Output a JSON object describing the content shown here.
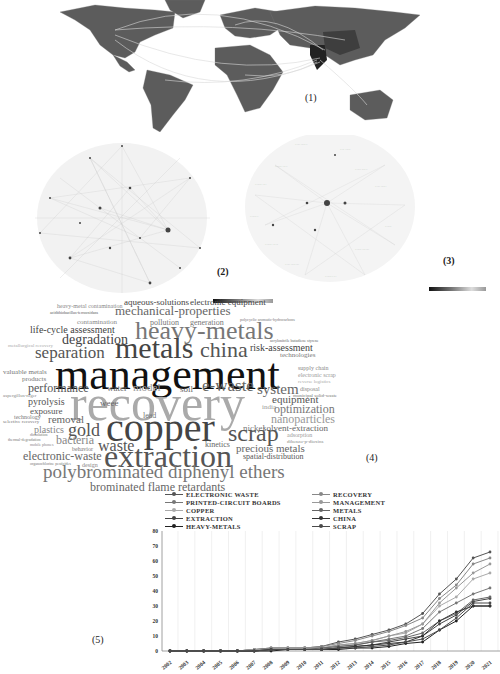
{
  "figure": {
    "panel_labels": [
      "(1)",
      "(2)",
      "(3)",
      "(4)",
      "(5)"
    ],
    "colorbar_ticks": [
      "2000",
      "2010",
      "2015",
      "2020"
    ]
  },
  "map": {
    "title": "World collaboration map",
    "label": "(1)",
    "highlighted_regions": [
      "India",
      "China",
      "USA",
      "Australia"
    ]
  },
  "network2": {
    "label": "(2)"
  },
  "network3": {
    "label": "(3)"
  },
  "wordcloud": {
    "label": "(4)",
    "words": [
      {
        "text": "heavy-metal contamination",
        "size": 6,
        "x": 57,
        "y": 303,
        "color": "#888"
      },
      {
        "text": "aqueous-solutions",
        "size": 9,
        "x": 124,
        "y": 298,
        "color": "#444"
      },
      {
        "text": "electronic equipment",
        "size": 9,
        "x": 190,
        "y": 298,
        "color": "#444"
      },
      {
        "text": "acidithiobacillus-ferrooxidans",
        "size": 4,
        "x": 50,
        "y": 311,
        "color": "#555"
      },
      {
        "text": "mechanical-properties",
        "size": 13,
        "x": 115,
        "y": 304,
        "color": "#666"
      },
      {
        "text": "polycyclic aromatic-hydrocarbons",
        "size": 4,
        "x": 240,
        "y": 318,
        "color": "#777"
      },
      {
        "text": "contamination",
        "size": 7,
        "x": 77,
        "y": 319,
        "color": "#888"
      },
      {
        "text": "pollution",
        "size": 8,
        "x": 150,
        "y": 319,
        "color": "#777"
      },
      {
        "text": "generation",
        "size": 8,
        "x": 190,
        "y": 319,
        "color": "#777"
      },
      {
        "text": "life-cycle assessment",
        "size": 10,
        "x": 30,
        "y": 325,
        "color": "#444"
      },
      {
        "text": "heavy-metals",
        "size": 26,
        "x": 135,
        "y": 318,
        "color": "#777"
      },
      {
        "text": "degradation",
        "size": 14,
        "x": 62,
        "y": 333,
        "color": "#444"
      },
      {
        "text": "acrylonitrile butadiene styrene",
        "size": 4,
        "x": 270,
        "y": 339,
        "color": "#666"
      },
      {
        "text": "metallurgical recovery",
        "size": 5,
        "x": 8,
        "y": 343,
        "color": "#aaa"
      },
      {
        "text": "risk-assessment",
        "size": 10,
        "x": 250,
        "y": 343,
        "color": "#444"
      },
      {
        "text": "separation",
        "size": 17,
        "x": 35,
        "y": 344,
        "color": "#555"
      },
      {
        "text": "metals",
        "size": 30,
        "x": 115,
        "y": 333,
        "color": "#444"
      },
      {
        "text": "china",
        "size": 22,
        "x": 200,
        "y": 339,
        "color": "#555"
      },
      {
        "text": "technologies",
        "size": 7,
        "x": 280,
        "y": 352,
        "color": "#777"
      },
      {
        "text": "valuable metals",
        "size": 7,
        "x": 3,
        "y": 369,
        "color": "#777"
      },
      {
        "text": "management",
        "size": 44,
        "x": 55,
        "y": 353,
        "color": "#111"
      },
      {
        "text": "supply chain",
        "size": 6,
        "x": 298,
        "y": 365,
        "color": "#888"
      },
      {
        "text": "electronic scrap",
        "size": 6,
        "x": 298,
        "y": 372,
        "color": "#999"
      },
      {
        "text": "reverse logistics",
        "size": 5,
        "x": 298,
        "y": 379,
        "color": "#aaa"
      },
      {
        "text": "products",
        "size": 7,
        "x": 22,
        "y": 376,
        "color": "#777"
      },
      {
        "text": "performance",
        "size": 12,
        "x": 28,
        "y": 382,
        "color": "#555"
      },
      {
        "text": "water",
        "size": 9,
        "x": 107,
        "y": 384,
        "color": "#666"
      },
      {
        "text": "model",
        "size": 11,
        "x": 133,
        "y": 382,
        "color": "#999"
      },
      {
        "text": "soil",
        "size": 9,
        "x": 180,
        "y": 385,
        "color": "#666"
      },
      {
        "text": "e-waste",
        "size": 17,
        "x": 202,
        "y": 377,
        "color": "#666"
      },
      {
        "text": "system",
        "size": 15,
        "x": 257,
        "y": 382,
        "color": "#666"
      },
      {
        "text": "disposal",
        "size": 6,
        "x": 300,
        "y": 386,
        "color": "#888"
      },
      {
        "text": "municipal solid-waste",
        "size": 5,
        "x": 293,
        "y": 393,
        "color": "#777"
      },
      {
        "text": "aspergillus-niger",
        "size": 5,
        "x": 3,
        "y": 393,
        "color": "#888"
      },
      {
        "text": "recovery",
        "size": 50,
        "x": 70,
        "y": 378,
        "color": "#aaa"
      },
      {
        "text": "equipment",
        "size": 11,
        "x": 272,
        "y": 394,
        "color": "#555"
      },
      {
        "text": "pyrolysis",
        "size": 10,
        "x": 28,
        "y": 397,
        "color": "#555"
      },
      {
        "text": "weee",
        "size": 9,
        "x": 100,
        "y": 399,
        "color": "#666"
      },
      {
        "text": "india",
        "size": 7,
        "x": 262,
        "y": 404,
        "color": "#999"
      },
      {
        "text": "optimization",
        "size": 12,
        "x": 274,
        "y": 403,
        "color": "#777"
      },
      {
        "text": "exposure",
        "size": 9,
        "x": 30,
        "y": 407,
        "color": "#555"
      },
      {
        "text": "nanoparticles",
        "size": 12,
        "x": 271,
        "y": 413,
        "color": "#999"
      },
      {
        "text": "technology",
        "size": 6,
        "x": 14,
        "y": 414,
        "color": "#777"
      },
      {
        "text": "selective recovery",
        "size": 5,
        "x": 3,
        "y": 419,
        "color": "#777"
      },
      {
        "text": "lead",
        "size": 8,
        "x": 143,
        "y": 412,
        "color": "#777"
      },
      {
        "text": "removal",
        "size": 11,
        "x": 48,
        "y": 414,
        "color": "#666"
      },
      {
        "text": "copper",
        "size": 40,
        "x": 106,
        "y": 408,
        "color": "#444"
      },
      {
        "text": "plastics",
        "size": 10,
        "x": 34,
        "y": 425,
        "color": "#888"
      },
      {
        "text": "gold",
        "size": 18,
        "x": 68,
        "y": 421,
        "color": "#555"
      },
      {
        "text": "nickel",
        "size": 9,
        "x": 243,
        "y": 424,
        "color": "#777"
      },
      {
        "text": "solvent-extraction",
        "size": 9,
        "x": 263,
        "y": 424,
        "color": "#666"
      },
      {
        "text": "scrap",
        "size": 24,
        "x": 228,
        "y": 421,
        "color": "#555"
      },
      {
        "text": "adsorption",
        "size": 6,
        "x": 287,
        "y": 432,
        "color": "#999"
      },
      {
        "text": "dibenzo-p-dioxins",
        "size": 5,
        "x": 287,
        "y": 439,
        "color": "#888"
      },
      {
        "text": "dissolution",
        "size": 4,
        "x": 30,
        "y": 433,
        "color": "#777"
      },
      {
        "text": "thermal-degradation",
        "size": 4,
        "x": 8,
        "y": 438,
        "color": "#777"
      },
      {
        "text": "mobile phones",
        "size": 4,
        "x": 30,
        "y": 443,
        "color": "#888"
      },
      {
        "text": "bacteria",
        "size": 12,
        "x": 56,
        "y": 434,
        "color": "#888"
      },
      {
        "text": "kinetics",
        "size": 8,
        "x": 205,
        "y": 441,
        "color": "#666"
      },
      {
        "text": "behavior",
        "size": 6,
        "x": 72,
        "y": 446,
        "color": "#777"
      },
      {
        "text": "waste",
        "size": 16,
        "x": 98,
        "y": 438,
        "color": "#555"
      },
      {
        "text": "precious metals",
        "size": 11,
        "x": 236,
        "y": 443,
        "color": "#666"
      },
      {
        "text": "electronic-waste",
        "size": 12,
        "x": 23,
        "y": 450,
        "color": "#666"
      },
      {
        "text": "extraction",
        "size": 32,
        "x": 104,
        "y": 440,
        "color": "#555"
      },
      {
        "text": "spatial-distribution",
        "size": 8,
        "x": 243,
        "y": 453,
        "color": "#555"
      },
      {
        "text": "organochlorine pesticides",
        "size": 4,
        "x": 30,
        "y": 462,
        "color": "#777"
      },
      {
        "text": "design",
        "size": 6,
        "x": 82,
        "y": 462,
        "color": "#888"
      },
      {
        "text": "polybrominated diphenyl ethers",
        "size": 19,
        "x": 43,
        "y": 462,
        "color": "#777"
      },
      {
        "text": "brominated flame retardants",
        "size": 12,
        "x": 90,
        "y": 481,
        "color": "#666"
      }
    ]
  },
  "chart_data": {
    "type": "line",
    "title": "",
    "label": "(5)",
    "xlabel": "",
    "ylabel": "",
    "ylim": [
      0,
      80
    ],
    "yticks": [
      0,
      10,
      20,
      30,
      40,
      50,
      60,
      70,
      80
    ],
    "grid": "vertical",
    "legend_position": "top",
    "categories": [
      "2002",
      "2003",
      "2004",
      "2005",
      "2006",
      "2007",
      "2008",
      "2009",
      "2010",
      "2011",
      "2012",
      "2013",
      "2014",
      "2015",
      "2016",
      "2017",
      "2018",
      "2019",
      "2020",
      "2021"
    ],
    "series": [
      {
        "name": "ELECTRONIC WASTE",
        "color": "#555555",
        "values": [
          0,
          0,
          0,
          0,
          0,
          1,
          2,
          2,
          2,
          3,
          6,
          8,
          11,
          14,
          18,
          25,
          38,
          48,
          62,
          66
        ]
      },
      {
        "name": "PRINTED-CIRCUIT BOARDS",
        "color": "#777777",
        "values": [
          0,
          0,
          0,
          0,
          0,
          1,
          1,
          1,
          2,
          2,
          3,
          4,
          6,
          8,
          10,
          15,
          26,
          32,
          38,
          42
        ]
      },
      {
        "name": "COPPER",
        "color": "#aaaaaa",
        "values": [
          0,
          0,
          0,
          0,
          0,
          1,
          1,
          2,
          2,
          2,
          4,
          5,
          7,
          10,
          12,
          18,
          30,
          36,
          48,
          52
        ]
      },
      {
        "name": "EXTRACTION",
        "color": "#444444",
        "values": [
          0,
          0,
          0,
          0,
          0,
          0,
          1,
          1,
          1,
          1,
          2,
          3,
          4,
          6,
          8,
          10,
          18,
          24,
          33,
          35
        ]
      },
      {
        "name": "HEAVY-METALS",
        "color": "#222222",
        "values": [
          0,
          0,
          0,
          0,
          0,
          0,
          0,
          1,
          1,
          1,
          1,
          2,
          2,
          3,
          5,
          6,
          14,
          20,
          30,
          30
        ]
      },
      {
        "name": "RECOVERY",
        "color": "#888888",
        "values": [
          0,
          0,
          0,
          0,
          0,
          1,
          2,
          2,
          2,
          3,
          5,
          7,
          10,
          13,
          17,
          22,
          35,
          44,
          58,
          62
        ]
      },
      {
        "name": "MANAGEMENT",
        "color": "#999999",
        "values": [
          0,
          0,
          0,
          0,
          0,
          1,
          1,
          2,
          2,
          2,
          4,
          5,
          7,
          10,
          13,
          18,
          32,
          42,
          52,
          58
        ]
      },
      {
        "name": "METALS",
        "color": "#666666",
        "values": [
          0,
          0,
          0,
          0,
          0,
          0,
          1,
          1,
          1,
          2,
          3,
          4,
          6,
          7,
          9,
          12,
          20,
          25,
          34,
          36
        ]
      },
      {
        "name": "CHINA",
        "color": "#333333",
        "values": [
          0,
          0,
          0,
          0,
          0,
          0,
          1,
          1,
          1,
          1,
          2,
          3,
          4,
          5,
          6,
          10,
          20,
          26,
          30,
          30
        ]
      },
      {
        "name": "SCRAP",
        "color": "#4a4a4a",
        "values": [
          0,
          0,
          0,
          0,
          0,
          0,
          1,
          1,
          1,
          1,
          2,
          2,
          3,
          4,
          6,
          8,
          14,
          22,
          32,
          32
        ]
      }
    ]
  }
}
